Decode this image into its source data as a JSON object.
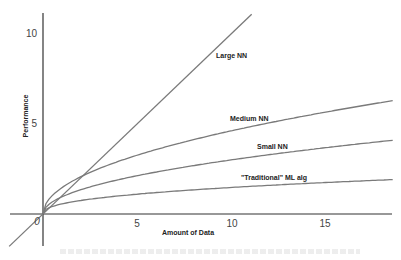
{
  "chart_data": {
    "type": "line",
    "title": "",
    "xlabel": "Amount of Data",
    "ylabel": "Performance",
    "xlim": [
      -1.8,
      18.6
    ],
    "ylim": [
      -1.8,
      11.2
    ],
    "x_ticks": [
      5,
      10,
      15
    ],
    "y_ticks": [
      5,
      10
    ],
    "origin_label": "0",
    "grid": false,
    "legend": "inline labels",
    "series": [
      {
        "name": "Large NN",
        "shape": "linear",
        "x": [
          -1.8,
          0,
          5,
          10,
          11.1
        ],
        "values": [
          -1.8,
          0,
          5,
          10,
          11.1
        ]
      },
      {
        "name": "Medium NN",
        "shape": "sqrt",
        "x": [
          0,
          2.1,
          5,
          10,
          15,
          18.6
        ],
        "values": [
          0,
          2.1,
          3.2,
          4.6,
          5.6,
          6.3
        ]
      },
      {
        "name": "Small NN",
        "shape": "sqrt",
        "x": [
          0,
          2,
          5,
          10,
          15,
          18.6
        ],
        "values": [
          0,
          1.35,
          2.1,
          3.0,
          3.7,
          4.1
        ]
      },
      {
        "name": "\"Traditional\" ML alg",
        "shape": "log-like",
        "x": [
          0,
          2,
          5,
          10,
          15,
          18.6
        ],
        "values": [
          0,
          0.75,
          1.1,
          1.45,
          1.7,
          1.9
        ]
      }
    ],
    "colors": {
      "lines": "#7a7a7a",
      "axes": "#333333"
    }
  },
  "labels": {
    "large": "Large NN",
    "medium": "Medium NN",
    "small": "Small NN",
    "traditional": "\"Traditional\" ML alg",
    "xlabel": "Amount of Data",
    "ylabel": "Performance",
    "origin": "0",
    "x5": "5",
    "x10": "10",
    "x15": "15",
    "y5": "5",
    "y10": "10"
  }
}
